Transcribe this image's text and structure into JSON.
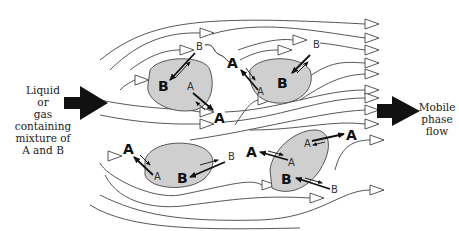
{
  "left_label": {
    "lines": [
      "Liquid",
      "or",
      "gas",
      "containing",
      "mixture of",
      "A and B"
    ]
  },
  "right_label": {
    "lines": [
      "Mobile",
      "phase",
      "flow"
    ]
  },
  "particles": [
    {
      "id": "top-left",
      "labels": {
        "big": "B",
        "small_in": "A",
        "outside_small": "B",
        "outside_big": "A"
      }
    },
    {
      "id": "top-right",
      "labels": {
        "big": "B",
        "small_in": "A",
        "outside_small": "B",
        "outside_big": "A"
      }
    },
    {
      "id": "bottom-left",
      "labels": {
        "big": "B",
        "small_in": "A",
        "outside_small": "B",
        "outside_big": "A"
      }
    },
    {
      "id": "bottom-right",
      "labels": {
        "big": "B",
        "small_in": "A",
        "outside_small": "B",
        "outside_big": "A"
      }
    }
  ],
  "species": {
    "a": "A",
    "b": "B"
  },
  "colors": {
    "particle_fill": "#cfcfcf",
    "arrow": "#111111",
    "flow_line": "#444444"
  }
}
